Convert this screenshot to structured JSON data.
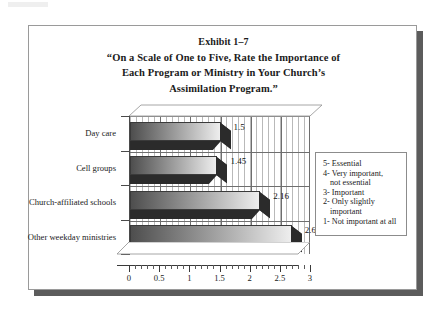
{
  "panel": {
    "exhibit_label": "Exhibit 1–7",
    "title_lines": [
      "“On a Scale of One to Five, Rate the Importance of",
      "Each Program or Ministry in Your Church’s",
      "Assimilation Program.”"
    ]
  },
  "colors": {
    "panel_border": "#9a9a9a",
    "shadow": "#5c5c5c",
    "axis": "#3a3a3a",
    "grid": "#6e6e6e",
    "hatch": "#b9b9b9",
    "bar_dark": "#4e4e4e",
    "bar_light": "#eeeeee",
    "bar_side": "#2b2b2b",
    "text": "#1a1a1a"
  },
  "legend": {
    "title": "Rating scale",
    "lines": [
      {
        "text": "5- Essential",
        "indent": false
      },
      {
        "text": "4- Very important,",
        "indent": false
      },
      {
        "text": "not essential",
        "indent": true
      },
      {
        "text": "3- Important",
        "indent": false
      },
      {
        "text": "2- Only slightly",
        "indent": false
      },
      {
        "text": "important",
        "indent": true
      },
      {
        "text": "1- Not important at all",
        "indent": false
      }
    ]
  },
  "chart_data": {
    "type": "bar",
    "orientation": "horizontal",
    "title": "“On a Scale of One to Five, Rate the Importance of Each Program or Ministry in Your Church’s Assimilation Program.”",
    "subtitle": "Exhibit 1–7",
    "xlabel": "",
    "ylabel": "",
    "categories": [
      "Day care",
      "Cell groups",
      "Church-affiliated schools",
      "Other weekday ministries"
    ],
    "values": [
      1.5,
      1.45,
      2.16,
      2.68
    ],
    "value_labels": [
      "1.5",
      "1.45",
      "2.16",
      "2.68"
    ],
    "xlim": [
      0,
      3
    ],
    "xticks": [
      0,
      0.5,
      1,
      1.5,
      2,
      2.5,
      3
    ],
    "xtick_labels": [
      "0",
      "0.5",
      "1",
      "1.5",
      "2",
      "2.5",
      "3"
    ],
    "minor_ticks_per_interval": 5,
    "grid": true,
    "grid_axis": "x",
    "legend_position": "right",
    "style_3d": true
  }
}
